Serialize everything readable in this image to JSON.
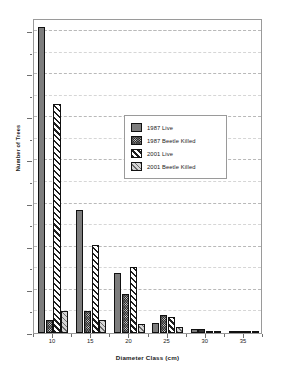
{
  "chart_data": {
    "type": "bar",
    "title": "",
    "subtitle": "",
    "xlabel": "Diameter Class (cm)",
    "ylabel": "Number of Trees",
    "categories": [
      "10",
      "15",
      "20",
      "25",
      "30",
      "35"
    ],
    "series": [
      {
        "name": "1987 Live",
        "values": [
          710,
          285,
          140,
          23,
          10,
          2
        ]
      },
      {
        "name": "1987 Beetle Killed",
        "values": [
          30,
          52,
          90,
          41,
          9,
          2
        ]
      },
      {
        "name": "2001 Live",
        "values": [
          530,
          203,
          152,
          38,
          3,
          2
        ]
      },
      {
        "name": "2001 Beetle Killed",
        "values": [
          50,
          30,
          22,
          13,
          2,
          1
        ]
      }
    ],
    "ylim": [
      0,
      730
    ],
    "yticks": [
      0,
      100,
      200,
      300,
      400,
      500,
      600,
      700
    ],
    "yticklabels": [
      "0",
      "100",
      "200",
      "300",
      "400",
      "500",
      "600",
      "700"
    ],
    "yminorticks": [
      50,
      150,
      250,
      350,
      450,
      550,
      650,
      700
    ],
    "xticklabels": [
      "10",
      "15",
      "20",
      "25",
      "30",
      "35"
    ],
    "grid": "horizontal-dashed",
    "legend_position": "center-right",
    "legend": [
      {
        "label": "1987 Live",
        "pattern": "grey-dotted",
        "color": "#7d7d7d"
      },
      {
        "label": "1987 Beetle Killed",
        "pattern": "dark-checkered-dotted",
        "color": "#2a2a2a"
      },
      {
        "label": "2001 Live",
        "pattern": "white-bold-diagonal",
        "color": "#ffffff"
      },
      {
        "label": "2001 Beetle Killed",
        "pattern": "grey-thin-diagonal",
        "color": "#d5d5d5"
      }
    ]
  }
}
